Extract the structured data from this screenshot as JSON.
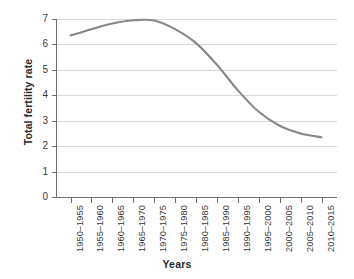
{
  "chart_data": {
    "type": "line",
    "title": "",
    "xlabel": "Years",
    "ylabel": "Total fertility rate",
    "ylim": [
      0,
      7
    ],
    "yticks": [
      0,
      1,
      2,
      3,
      4,
      5,
      6,
      7
    ],
    "ytick_labels": [
      "0",
      "1",
      "2",
      "3",
      "4",
      "5",
      "6",
      "7"
    ],
    "grid": true,
    "grid_axis": "y",
    "legend": false,
    "legend_position": "none",
    "categories": [
      "1950–1955",
      "1955–1960",
      "1960–1965",
      "1965–1970",
      "1970–1975",
      "1975–1980",
      "1980–1985",
      "1985–1990",
      "1990–1995",
      "1995–2000",
      "2000–2005",
      "2005–2010",
      "2010–2015"
    ],
    "values": [
      6.35,
      6.6,
      6.82,
      6.95,
      6.94,
      6.6,
      6.05,
      5.2,
      4.2,
      3.35,
      2.8,
      2.5,
      2.35
    ],
    "series": [
      {
        "name": "Total fertility rate",
        "color": "#878787",
        "values": [
          6.35,
          6.6,
          6.82,
          6.95,
          6.94,
          6.6,
          6.05,
          5.2,
          4.2,
          3.35,
          2.8,
          2.5,
          2.35
        ]
      }
    ]
  },
  "colors": {
    "line": "#878787",
    "gridline": "#d9d9d9",
    "axis": "#6e6e6e",
    "text": "#3a3a3a",
    "title_text": "#2b2b2b",
    "background": "#ffffff"
  }
}
